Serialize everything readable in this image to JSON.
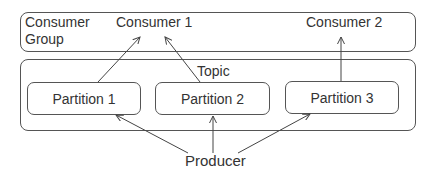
{
  "diagram": {
    "consumer_group": {
      "label_line1": "Consumer",
      "label_line2": "Group",
      "consumers": [
        "Consumer 1",
        "Consumer 2"
      ]
    },
    "topic": {
      "label": "Topic",
      "partitions": [
        "Partition 1",
        "Partition 2",
        "Partition 3"
      ]
    },
    "producer": "Producer",
    "edges": [
      {
        "from": "Producer",
        "to": "Partition 1"
      },
      {
        "from": "Producer",
        "to": "Partition 2"
      },
      {
        "from": "Producer",
        "to": "Partition 3"
      },
      {
        "from": "Partition 1",
        "to": "Consumer 1"
      },
      {
        "from": "Partition 2",
        "to": "Consumer 1"
      },
      {
        "from": "Partition 3",
        "to": "Consumer 2"
      }
    ],
    "colors": {
      "stroke": "#555555",
      "text": "#333333"
    }
  }
}
